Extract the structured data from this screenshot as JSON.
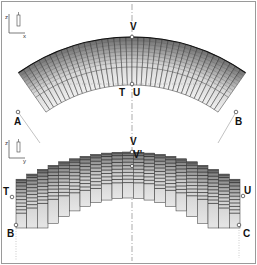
{
  "figure": {
    "top_view": {
      "axis_labels": {
        "vertical": "z",
        "horizontal": "x"
      },
      "points": {
        "A": "A",
        "B": "B",
        "T": "T",
        "U": "U",
        "V": "V"
      },
      "segments": 40
    },
    "bottom_view": {
      "axis_labels": {
        "vertical": "z",
        "horizontal": "y"
      },
      "points": {
        "T": "T",
        "U": "U",
        "B": "B",
        "C": "C",
        "V": "V",
        "V_prime": "V'"
      },
      "columns": 21
    },
    "colors": {
      "stroke": "#222222",
      "fill_light": "#e8e8e8",
      "fill_dark": "#707070",
      "border": "#9a9a9a",
      "guide": "#888888"
    }
  }
}
